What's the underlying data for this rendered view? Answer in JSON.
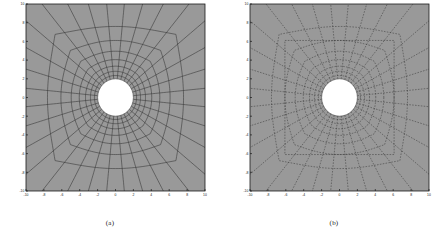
{
  "figure": {
    "width": 443,
    "height": 235,
    "background_color": "#ffffff",
    "panel_fill_color": "#999999",
    "mesh_line_color": "#3a3a3a",
    "axis_color": "#1a1a1a",
    "hole_fill_color": "#ffffff"
  },
  "panels": [
    {
      "id": "a",
      "caption": "(a)",
      "line_style": "solid",
      "has_inner_square_boundary": false,
      "plot_box": {
        "x": 12,
        "y": 4,
        "width": 196,
        "height": 206
      }
    },
    {
      "id": "b",
      "caption": "(b)",
      "line_style": "dashed",
      "has_inner_square_boundary": true,
      "plot_box": {
        "x": 236,
        "y": 4,
        "width": 196,
        "height": 206
      }
    }
  ],
  "chart_data": {
    "type": "line",
    "title": "",
    "xlabel": "",
    "ylabel": "",
    "xlim": [
      -10,
      10
    ],
    "ylim": [
      -10,
      10
    ],
    "grid": false,
    "legend": null,
    "x_tick_labels": [
      "-10",
      "-8",
      "-6",
      "-4",
      "-2",
      "0",
      "2",
      "4",
      "6",
      "8",
      "10"
    ],
    "x_tick_values": [
      -10,
      -8,
      -6,
      -4,
      -2,
      0,
      2,
      4,
      6,
      8,
      10
    ],
    "y_tick_labels": [
      "10",
      "8",
      "6",
      "4",
      "2",
      "0",
      "-2",
      "-4",
      "-6",
      "-8",
      "-10"
    ],
    "y_tick_values": [
      10,
      8,
      6,
      4,
      2,
      0,
      -2,
      -4,
      -6,
      -8,
      -10
    ],
    "mesh": {
      "description": "Radial finite-element mesh of a square plate with a central circular hole; radial spokes plus concentric rounded-square rings graded from the hole outward to the outer boundary.",
      "hole_radius": 2.0,
      "domain_half_width": 10.0,
      "radial_spokes": 32,
      "circumferential_rings": 8,
      "ring_radii": [
        2.0,
        2.35,
        2.8,
        3.35,
        4.05,
        4.95,
        6.1,
        7.6,
        10.0
      ],
      "inner_square_half_width": 6.1,
      "series": [
        {
          "name": "mesh-radial-lines",
          "values": 32
        },
        {
          "name": "mesh-ring-lines",
          "values": 8
        }
      ]
    }
  }
}
